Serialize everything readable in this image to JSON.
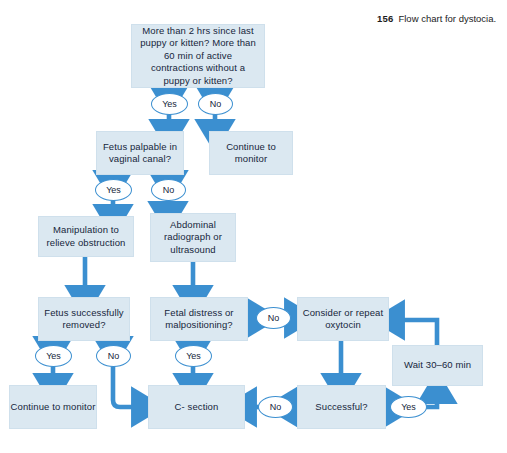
{
  "figure": {
    "number": "156",
    "caption": "Flow chart for dystocia."
  },
  "accent_colors": {
    "box_fill": "#dbe8f1",
    "arrow_blue": "#3b8fd0",
    "text_navy": "#16263b",
    "oval_stroke": "#3b8fd0",
    "page_background": "#ffffff"
  },
  "nodes": [
    {
      "id": "start",
      "label": "More than 2 hrs since last puppy or kitten? More than 60 min of active contractions without a puppy or kitten?"
    },
    {
      "id": "monitor_top",
      "label": "Continue to monitor"
    },
    {
      "id": "palpable",
      "label": "Fetus palpable in vaginal canal?"
    },
    {
      "id": "manipulation",
      "label": "Manipulation to relieve obstruction"
    },
    {
      "id": "radiograph",
      "label": "Abdominal radiograph or ultrasound"
    },
    {
      "id": "removed",
      "label": "Fetus successfully removed?"
    },
    {
      "id": "distress",
      "label": "Fetal distress or malpositioning?"
    },
    {
      "id": "oxytocin",
      "label": "Consider or repeat oxytocin"
    },
    {
      "id": "wait",
      "label": "Wait 30–60 min"
    },
    {
      "id": "monitor_bot",
      "label": "Continue to monitor"
    },
    {
      "id": "csection",
      "label": "C- section"
    },
    {
      "id": "successful",
      "label": "Successful?"
    }
  ],
  "decisions": [
    {
      "id": "start_yes",
      "label": "Yes"
    },
    {
      "id": "start_no",
      "label": "No"
    },
    {
      "id": "palpable_yes",
      "label": "Yes"
    },
    {
      "id": "palpable_no",
      "label": "No"
    },
    {
      "id": "removed_yes",
      "label": "Yes"
    },
    {
      "id": "removed_no",
      "label": "No"
    },
    {
      "id": "distress_yes",
      "label": "Yes"
    },
    {
      "id": "distress_no",
      "label": "No"
    },
    {
      "id": "successful_no",
      "label": "No"
    },
    {
      "id": "successful_yes",
      "label": "Yes"
    }
  ]
}
